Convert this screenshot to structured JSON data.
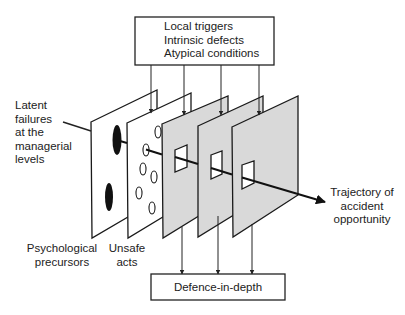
{
  "diagram": {
    "top_box": {
      "lines": [
        "Local triggers",
        "Intrinsic defects",
        "Atypical conditions"
      ]
    },
    "bottom_box": {
      "label": "Defence-in-depth"
    },
    "left_label": {
      "lines": [
        "Latent",
        "failures",
        "at the",
        "managerial",
        "levels"
      ]
    },
    "plane_labels": {
      "psychological": [
        "Psychological",
        "precursors"
      ],
      "unsafe": [
        "Unsafe",
        "acts"
      ]
    },
    "trajectory_label": {
      "lines": [
        "Trajectory of",
        "accident",
        "opportunity"
      ]
    },
    "planes": [
      {
        "name": "Latent failures at the managerial levels",
        "fill": "#ffffff"
      },
      {
        "name": "Psychological precursors",
        "fill": "#ffffff"
      },
      {
        "name": "Unsafe acts",
        "fill": "#d9d9d9"
      },
      {
        "name": "Defence layer 2",
        "fill": "#d9d9d9"
      },
      {
        "name": "Defence layer 3",
        "fill": "#d9d9d9"
      }
    ],
    "colors": {
      "stroke": "#1a1a1a",
      "defence_fill": "#d9d9d9",
      "background": "#ffffff"
    }
  }
}
